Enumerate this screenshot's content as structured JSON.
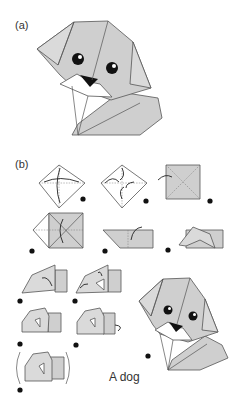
{
  "figure": {
    "panel_a_label": "(a)",
    "panel_b_label": "(b)",
    "caption": "A dog",
    "colors": {
      "paper": "#cfcfcf",
      "outline": "#555555",
      "mouth": "#ffffff",
      "nose": "#111111"
    },
    "panel_a": {
      "subject": "finished origami dog head",
      "icon": "origami-dog-icon"
    },
    "panel_b": {
      "steps": [
        {
          "index": 1,
          "shape": "diamond with folding arrows"
        },
        {
          "index": 2,
          "shape": "diamond with inward folds"
        },
        {
          "index": 3,
          "shape": "square turned over"
        },
        {
          "index": 4,
          "shape": "square with flap"
        },
        {
          "index": 5,
          "shape": "folded rectangle"
        },
        {
          "index": 6,
          "shape": "raised flap"
        },
        {
          "index": 7,
          "shape": "ear fold"
        },
        {
          "index": 8,
          "shape": "second ear fold"
        },
        {
          "index": 9,
          "shape": "shaping head"
        },
        {
          "index": 10,
          "shape": "fold back corner"
        },
        {
          "index": 11,
          "shape": "turn over"
        },
        {
          "index": 12,
          "shape": "finished dog"
        }
      ]
    }
  }
}
